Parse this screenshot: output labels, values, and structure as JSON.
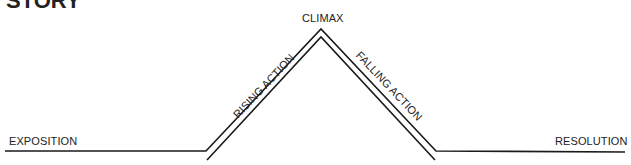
{
  "diagram": {
    "title": "STORY",
    "labels": {
      "exposition": "EXPOSITION",
      "rising_action": "RISING ACTION",
      "climax": "CLIMAX",
      "falling_action": "FALLING ACTION",
      "resolution": "RESOLUTION"
    },
    "colors": {
      "line": "#1a1a1a",
      "text": "#222222",
      "background": "#ffffff"
    }
  }
}
